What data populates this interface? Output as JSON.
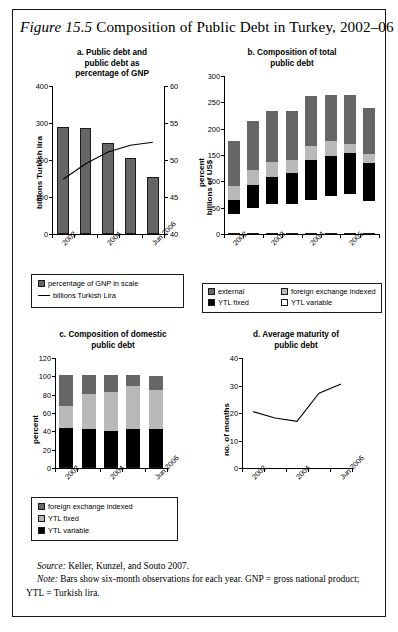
{
  "figure": {
    "label": "Figure 15.5",
    "title": "Composition of Public Debt in Turkey, 2002–06"
  },
  "colors": {
    "external": "#666666",
    "fx_indexed": "#b9b9b9",
    "ytl_fixed": "#000000",
    "ytl_variable": "#ffffff",
    "bar_gray": "#666666",
    "line": "#000000",
    "border": "#1a1a1a"
  },
  "panel_a": {
    "title_line1": "a. Public debt and",
    "title_line2": "public debt as",
    "title_line3": "percentage of GNP",
    "legend": [
      {
        "label": "percentage of GNP in scale",
        "marker": "swatch",
        "color": "#666666"
      },
      {
        "label": "billions Turkish Lira",
        "marker": "line",
        "color": "#000000"
      }
    ]
  },
  "panel_b": {
    "title_line1": "b. Composition of total",
    "title_line2": "public debt",
    "legend": [
      {
        "label": "external",
        "color": "#666666"
      },
      {
        "label": "foreign exchange indexed",
        "color": "#b9b9b9"
      },
      {
        "label": "YTL fixed",
        "color": "#000000"
      },
      {
        "label": "YTL variable",
        "color": "#ffffff"
      }
    ]
  },
  "panel_c": {
    "title_line1": "c. Composition of domestic",
    "title_line2": "public debt",
    "legend": [
      {
        "label": "foreign exchange indexed",
        "color": "#666666"
      },
      {
        "label": "YTL fixed",
        "color": "#b9b9b9"
      },
      {
        "label": "YTL variable",
        "color": "#000000"
      }
    ]
  },
  "panel_d": {
    "title_line1": "d. Average maturity of",
    "title_line2": "public debt"
  },
  "source": {
    "label": "Source:",
    "text": " Keller, Kunzel, and Souto 2007."
  },
  "note": {
    "label": "Note:",
    "text": " Bars show six-month observations for each year. GNP = gross national product; YTL = Turkish lira."
  },
  "chart_data": [
    {
      "id": "a",
      "type": "bar",
      "title": "a. Public debt and public debt as percentage of GNP",
      "xlabel": "",
      "ylabel": "billions Turkish lira",
      "ylabel_right": "percent",
      "ylim": [
        0,
        400
      ],
      "yticks": [
        0,
        100,
        200,
        300,
        400
      ],
      "ylim_right": [
        40,
        60
      ],
      "yticks_right": [
        40,
        45,
        50,
        55,
        60
      ],
      "grid": false,
      "categories": [
        "2002",
        "",
        "2004",
        "",
        "Jun 2006"
      ],
      "tick_labels": [
        "2002",
        "2004",
        "Jun 2006"
      ],
      "series": [
        {
          "name": "billions Turkish Lira",
          "kind": "bar",
          "axis": "left",
          "values": [
            290,
            286,
            247,
            205,
            155
          ]
        },
        {
          "name": "percentage of GNP in scale",
          "kind": "line",
          "axis": "right",
          "values": [
            47.4,
            49.5,
            51.1,
            52.0,
            52.4
          ]
        }
      ]
    },
    {
      "id": "b",
      "type": "bar",
      "stacked": true,
      "title": "b. Composition of total public debt",
      "xlabel": "",
      "ylabel": "billions of US$",
      "ylim": [
        0,
        300
      ],
      "yticks": [
        0,
        50,
        100,
        150,
        200,
        250,
        300
      ],
      "grid": false,
      "categories": [
        "2002",
        "2002b",
        "2003",
        "2003b",
        "2004",
        "2004b",
        "2005"
      ],
      "tick_labels": [
        "2002",
        "2003",
        "2004",
        "2005"
      ],
      "series": [
        {
          "name": "YTL variable",
          "values": [
            36,
            48,
            56,
            55,
            63,
            71,
            74,
            60
          ]
        },
        {
          "name": "YTL fixed",
          "values": [
            26,
            44,
            51,
            59,
            75,
            76,
            78,
            72
          ]
        },
        {
          "name": "foreign exchange indexed",
          "values": [
            28,
            27,
            27,
            25,
            27,
            27,
            17,
            18
          ]
        },
        {
          "name": "external",
          "values": [
            85,
            94,
            98,
            92,
            95,
            89,
            93,
            88
          ]
        }
      ],
      "totals": [
        175,
        213,
        232,
        231,
        260,
        263,
        262,
        238
      ]
    },
    {
      "id": "c",
      "type": "bar",
      "stacked": true,
      "title": "c. Composition of domestic public debt",
      "xlabel": "",
      "ylabel": "percent",
      "ylim": [
        0,
        120
      ],
      "yticks": [
        0,
        20,
        40,
        60,
        80,
        100,
        120
      ],
      "grid": false,
      "categories": [
        "2002",
        "",
        "2004",
        "",
        "Jun 2006"
      ],
      "tick_labels": [
        "2002",
        "2004",
        "Jun 2006"
      ],
      "series": [
        {
          "name": "YTL variable",
          "values": [
            42,
            41,
            39,
            41,
            41
          ]
        },
        {
          "name": "YTL fixed",
          "values": [
            25,
            39,
            43,
            47,
            43
          ]
        },
        {
          "name": "foreign exchange indexed",
          "values": [
            33,
            20,
            18,
            12,
            15
          ]
        }
      ],
      "totals": [
        100,
        100,
        100,
        100,
        99
      ]
    },
    {
      "id": "d",
      "type": "line",
      "title": "d. Average maturity of public debt",
      "xlabel": "",
      "ylabel": "no. of months",
      "ylim": [
        0,
        40
      ],
      "yticks": [
        0,
        10,
        20,
        30,
        40
      ],
      "grid": false,
      "x": [
        "2002",
        "",
        "2004",
        "",
        "Jun 2006"
      ],
      "tick_labels": [
        "2002",
        "2004",
        "Jun 2006"
      ],
      "series": [
        {
          "name": "average maturity",
          "values": [
            20.5,
            18.2,
            17.0,
            27.2,
            30.5
          ]
        }
      ]
    }
  ]
}
